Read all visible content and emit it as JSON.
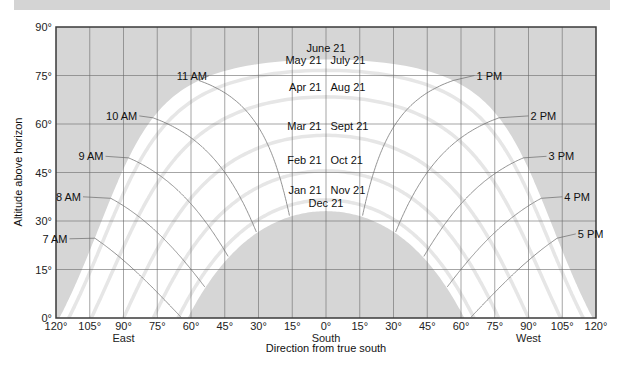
{
  "chart_data": {
    "type": "line",
    "xlabel": "Direction from true south",
    "ylabel": "Altitude above horizon",
    "xlim": [
      -120,
      120
    ],
    "ylim": [
      0,
      90
    ],
    "grid": true,
    "x_ticks": [
      "120°",
      "105°",
      "90°",
      "75°",
      "60°",
      "45°",
      "30°",
      "15°",
      "0°",
      "15°",
      "30°",
      "45°",
      "60°",
      "75°",
      "90°",
      "105°",
      "120°"
    ],
    "x_tick_values": [
      -120,
      -105,
      -90,
      -75,
      -60,
      -45,
      -30,
      -15,
      0,
      15,
      30,
      45,
      60,
      75,
      90,
      105,
      120
    ],
    "x_sublabels": [
      {
        "value": -90,
        "text": "East"
      },
      {
        "value": 0,
        "text": "South"
      },
      {
        "value": 90,
        "text": "West"
      }
    ],
    "y_ticks": [
      "0°",
      "15°",
      "30°",
      "45°",
      "60°",
      "75°",
      "90°"
    ],
    "y_tick_values": [
      0,
      15,
      30,
      45,
      60,
      75,
      90
    ],
    "latitude_deg": 33.5,
    "date_curves": [
      {
        "label": "June 21",
        "declination": 23.45
      },
      {
        "label": "May 21 / July 21",
        "declination": 20.1
      },
      {
        "label": "Apr 21 / Aug 21",
        "declination": 11.9
      },
      {
        "label": "Mar 21 / Sept 21",
        "declination": 0
      },
      {
        "label": "Feb 21 / Oct 21",
        "declination": -11.0
      },
      {
        "label": "Jan 21 / Nov 21",
        "declination": -20.0
      },
      {
        "label": "Dec 21",
        "declination": -23.45
      }
    ],
    "date_labels": [
      {
        "text": "June 21",
        "x": 0,
        "y": 83.5,
        "anchor": "middle"
      },
      {
        "text": "May 21",
        "x": -2,
        "y": 79.7,
        "anchor": "end"
      },
      {
        "text": "July 21",
        "x": 2,
        "y": 79.7,
        "anchor": "start"
      },
      {
        "text": "Apr 21",
        "x": -2,
        "y": 71.5,
        "anchor": "end"
      },
      {
        "text": "Aug 21",
        "x": 2,
        "y": 71.5,
        "anchor": "start"
      },
      {
        "text": "Mar 21",
        "x": -2,
        "y": 59.5,
        "anchor": "end"
      },
      {
        "text": "Sept 21",
        "x": 2,
        "y": 59.5,
        "anchor": "start"
      },
      {
        "text": "Feb 21",
        "x": -2,
        "y": 49,
        "anchor": "end"
      },
      {
        "text": "Oct 21",
        "x": 2,
        "y": 49,
        "anchor": "start"
      },
      {
        "text": "Jan 21",
        "x": -2,
        "y": 39.5,
        "anchor": "end"
      },
      {
        "text": "Nov 21",
        "x": 2,
        "y": 39.5,
        "anchor": "start"
      },
      {
        "text": "Dec 21",
        "x": 0,
        "y": 35.5,
        "anchor": "middle"
      }
    ],
    "hour_curves": [
      {
        "label": "7 AM",
        "hour": 7,
        "label_x": -114,
        "label_y": 24.5
      },
      {
        "label": "8 AM",
        "hour": 8,
        "label_x": -108,
        "label_y": 37.5
      },
      {
        "label": "9 AM",
        "hour": 9,
        "label_x": -98,
        "label_y": 50
      },
      {
        "label": "10 AM",
        "hour": 10,
        "label_x": -83,
        "label_y": 62.5
      },
      {
        "label": "11 AM",
        "hour": 11,
        "label_x": -52,
        "label_y": 75
      },
      {
        "label": "1 PM",
        "hour": 13,
        "label_x": 66,
        "label_y": 75
      },
      {
        "label": "2 PM",
        "hour": 14,
        "label_x": 90,
        "label_y": 62.5
      },
      {
        "label": "3 PM",
        "hour": 15,
        "label_x": 98,
        "label_y": 50
      },
      {
        "label": "4 PM",
        "hour": 16,
        "label_x": 105,
        "label_y": 37.5
      },
      {
        "label": "5 PM",
        "hour": 17,
        "label_x": 111,
        "label_y": 26
      }
    ],
    "colors": {
      "shade": "#d6d6d6",
      "sun_region": "#ffffff",
      "date_curve": "#e6e6e6",
      "hour_curve": "#777777",
      "grid": "#6a6a6a",
      "axis": "#3a3a3a"
    }
  }
}
